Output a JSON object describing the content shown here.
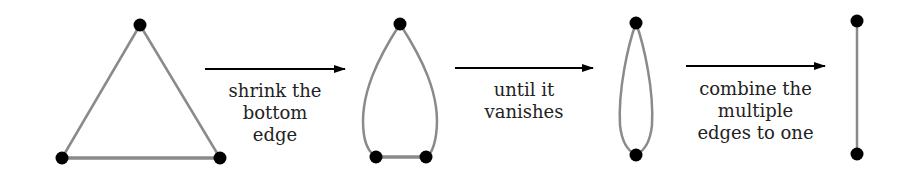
{
  "colors": {
    "edge": "#8a8a8a",
    "vertex": "#000000",
    "arrow": "#000000",
    "text": "#222222"
  },
  "steps": [
    {
      "label_lines": [
        "shrink the",
        "bottom",
        "edge"
      ]
    },
    {
      "label_lines": [
        "until it",
        "vanishes"
      ]
    },
    {
      "label_lines": [
        "combine the",
        "multiple",
        "edges to one"
      ]
    }
  ],
  "graphs": [
    {
      "name": "triangle",
      "vertices": [
        [
          140,
          25
        ],
        [
          62,
          158
        ],
        [
          220,
          158
        ]
      ]
    },
    {
      "name": "shrunk-bottom",
      "vertices": [
        [
          400,
          24
        ],
        [
          376,
          157
        ],
        [
          426,
          157
        ]
      ]
    },
    {
      "name": "double-edge",
      "vertices": [
        [
          636,
          23
        ],
        [
          636,
          155
        ]
      ]
    },
    {
      "name": "single-edge",
      "vertices": [
        [
          857,
          21
        ],
        [
          857,
          154
        ]
      ]
    }
  ]
}
